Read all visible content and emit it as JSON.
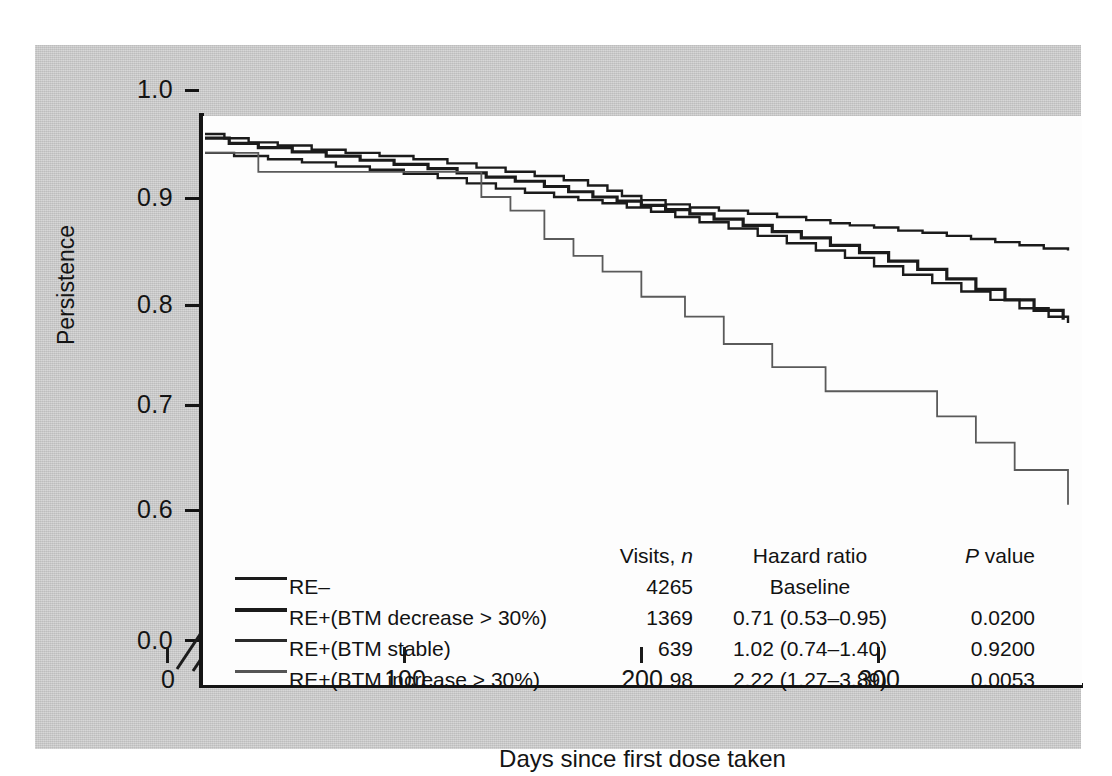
{
  "figure": {
    "panel_background": "#fdfdfd",
    "plate_background": "#c9c9c9",
    "axis_color": "#151515"
  },
  "axes": {
    "y_title": "Persistence",
    "x_title": "Days since first dose taken",
    "y_ticks": [
      "1.0",
      "0.9",
      "0.8",
      "0.7",
      "0.6",
      "0.0"
    ],
    "x_ticks": [
      "0",
      "100",
      "200",
      "300"
    ],
    "break_marker": "//"
  },
  "legend": {
    "headers": {
      "series": "",
      "visits": "Visits, n",
      "visits_plain": "Visits,",
      "visits_italic": "n",
      "hazard_ratio": "Hazard ratio",
      "p_value_italic": "P",
      "p_value_rest": " value"
    },
    "rows": [
      {
        "label": "RE–",
        "visits": "4265",
        "hazard_ratio": "Baseline",
        "p_value": ""
      },
      {
        "label": "RE+(BTM decrease > 30%)",
        "visits": "1369",
        "hazard_ratio": "0.71 (0.53–0.95)",
        "p_value": "0.0200"
      },
      {
        "label": "RE+(BTM stable)",
        "visits": "639",
        "hazard_ratio": "1.02 (0.74–1.40)",
        "p_value": "0.9200"
      },
      {
        "label": "RE+(BTM increase > 30%)",
        "visits": "98",
        "hazard_ratio": "2.22 (1.27–3.89)",
        "p_value": "0.0053"
      }
    ]
  },
  "chart_data": {
    "type": "line",
    "title": "",
    "xlabel": "Days since first dose taken",
    "ylabel": "Persistence",
    "xlim": [
      0,
      356
    ],
    "ylim": [
      0.6,
      1.0
    ],
    "y_axis_broken_at": 0.6,
    "grid": false,
    "legend_position": "inside-bottom-left",
    "step_style": "post",
    "series": [
      {
        "name": "RE–",
        "visits": 4265,
        "hazard_ratio": "Baseline",
        "p_value": null,
        "color": "#1b1b1b",
        "x": [
          0,
          8,
          18,
          30,
          44,
          58,
          72,
          86,
          100,
          112,
          124,
          136,
          148,
          158,
          166,
          172,
          180,
          190,
          200,
          212,
          224,
          236,
          248,
          258,
          266,
          276,
          286,
          296,
          306,
          316,
          326,
          336,
          346,
          356
        ],
        "y": [
          1.0,
          0.996,
          0.992,
          0.989,
          0.985,
          0.982,
          0.979,
          0.976,
          0.972,
          0.968,
          0.964,
          0.96,
          0.956,
          0.951,
          0.946,
          0.941,
          0.937,
          0.933,
          0.93,
          0.927,
          0.924,
          0.921,
          0.918,
          0.915,
          0.913,
          0.911,
          0.908,
          0.906,
          0.903,
          0.9,
          0.897,
          0.894,
          0.891,
          0.889
        ]
      },
      {
        "name": "RE+(BTM decrease > 30%)",
        "visits": 1369,
        "hazard_ratio": "0.71 (0.53–0.95)",
        "p_value": 0.02,
        "color": "#1b1b1b",
        "x": [
          0,
          10,
          22,
          36,
          50,
          64,
          78,
          92,
          104,
          116,
          128,
          140,
          150,
          160,
          170,
          180,
          190,
          200,
          210,
          222,
          234,
          246,
          258,
          270,
          282,
          294,
          306,
          318,
          330,
          342,
          354
        ],
        "y": [
          0.996,
          0.991,
          0.987,
          0.983,
          0.979,
          0.975,
          0.971,
          0.967,
          0.963,
          0.959,
          0.955,
          0.95,
          0.945,
          0.94,
          0.936,
          0.932,
          0.928,
          0.924,
          0.919,
          0.913,
          0.907,
          0.901,
          0.894,
          0.887,
          0.879,
          0.871,
          0.862,
          0.852,
          0.842,
          0.832,
          0.823
        ]
      },
      {
        "name": "RE+(BTM stable)",
        "visits": 639,
        "hazard_ratio": "1.02 (0.74–1.40)",
        "p_value": 0.92,
        "color": "#1b1b1b",
        "x": [
          0,
          12,
          26,
          40,
          54,
          68,
          82,
          96,
          108,
          120,
          132,
          144,
          154,
          164,
          174,
          184,
          194,
          204,
          216,
          228,
          240,
          252,
          264,
          276,
          288,
          300,
          312,
          324,
          336,
          348,
          356
        ],
        "y": [
          0.982,
          0.979,
          0.976,
          0.973,
          0.969,
          0.966,
          0.962,
          0.958,
          0.953,
          0.948,
          0.944,
          0.94,
          0.937,
          0.934,
          0.93,
          0.926,
          0.921,
          0.916,
          0.91,
          0.903,
          0.896,
          0.889,
          0.882,
          0.874,
          0.866,
          0.858,
          0.85,
          0.842,
          0.834,
          0.826,
          0.82
        ]
      },
      {
        "name": "RE+(BTM increase > 30%)",
        "visits": 98,
        "hazard_ratio": "2.22 (1.27–3.89)",
        "p_value": 0.0053,
        "color": "#5a5a5a",
        "x": [
          0,
          20,
          22,
          112,
          114,
          124,
          126,
          138,
          140,
          150,
          152,
          162,
          164,
          178,
          180,
          196,
          198,
          212,
          214,
          232,
          234,
          254,
          256,
          300,
          302,
          316,
          318,
          332,
          334,
          352,
          356
        ],
        "y": [
          0.982,
          0.982,
          0.964,
          0.964,
          0.94,
          0.94,
          0.927,
          0.927,
          0.9,
          0.9,
          0.884,
          0.884,
          0.869,
          0.869,
          0.845,
          0.845,
          0.826,
          0.826,
          0.8,
          0.8,
          0.778,
          0.778,
          0.755,
          0.755,
          0.731,
          0.731,
          0.706,
          0.706,
          0.68,
          0.68,
          0.647
        ]
      }
    ]
  }
}
